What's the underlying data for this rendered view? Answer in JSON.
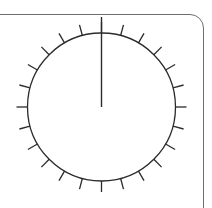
{
  "dial": {
    "center": {
      "x": 101.5,
      "y": 107
    },
    "radius": 74,
    "tick_count": 24,
    "tick_length": 11,
    "needle": {
      "angle_deg": 0,
      "tip_y": 17
    },
    "colors": {
      "stroke": "#2b2b2b",
      "frame": "#6e6e6e",
      "background": "#ffffff"
    }
  }
}
